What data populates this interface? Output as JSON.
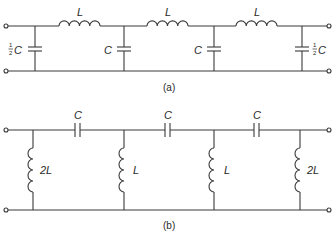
{
  "figure_a": {
    "caption": "(a)",
    "inductors": [
      {
        "label": "L"
      },
      {
        "label": "L"
      },
      {
        "label": "L"
      }
    ],
    "capacitors": [
      {
        "label": "C",
        "frac": "1/2",
        "num": "1",
        "den": "2"
      },
      {
        "label": "C"
      },
      {
        "label": "C"
      },
      {
        "label": "C",
        "frac": "1/2",
        "num": "1",
        "den": "2"
      }
    ]
  },
  "figure_b": {
    "caption": "(b)",
    "capacitors": [
      {
        "label": "C"
      },
      {
        "label": "C"
      },
      {
        "label": "C"
      }
    ],
    "inductors": [
      {
        "label": "2L"
      },
      {
        "label": "L"
      },
      {
        "label": "L"
      },
      {
        "label": "2L"
      }
    ]
  }
}
